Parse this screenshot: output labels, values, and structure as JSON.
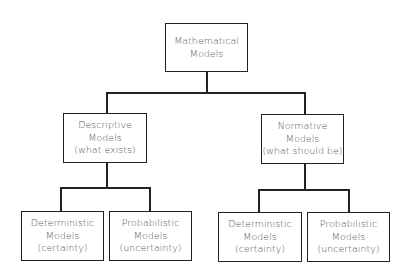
{
  "diagram": {
    "type": "hierarchy",
    "root": {
      "lines": [
        "Mathematical",
        "Models"
      ]
    },
    "level1": [
      {
        "lines": [
          "Descriptive",
          "Models",
          "(what exists)"
        ],
        "children": [
          {
            "lines": [
              "Deterministic",
              "Models",
              "(certainty)"
            ]
          },
          {
            "lines": [
              "Probabilistic",
              "Models",
              "(uncertainty)"
            ]
          }
        ]
      },
      {
        "lines": [
          "Normative",
          "Models",
          "(what should be)"
        ],
        "children": [
          {
            "lines": [
              "Deterministic",
              "Models",
              "(certainty)"
            ]
          },
          {
            "lines": [
              "Probabilistic",
              "Models",
              "(uncertainty)"
            ]
          }
        ]
      }
    ]
  },
  "colors": {
    "border": "#222222",
    "text": "#555555",
    "background": "#ffffff"
  }
}
